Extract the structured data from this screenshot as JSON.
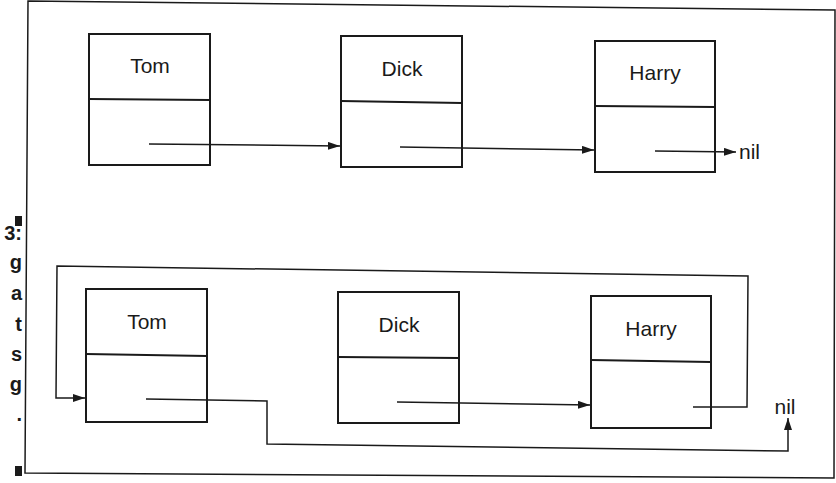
{
  "caption_fragments": {
    "top_marker": "■",
    "lines": [
      "3:",
      "g",
      "a",
      "t",
      "s",
      "g",
      "."
    ],
    "bottom_marker": "■"
  },
  "diagrams": [
    {
      "type": "linked-list",
      "nodes": [
        {
          "label": "Tom"
        },
        {
          "label": "Dick"
        },
        {
          "label": "Harry"
        }
      ],
      "terminator": "nil"
    },
    {
      "type": "circular-linked-list",
      "nodes": [
        {
          "label": "Tom"
        },
        {
          "label": "Dick"
        },
        {
          "label": "Harry"
        }
      ],
      "terminator": "nil"
    }
  ],
  "colors": {
    "stroke": "#1a1a1a",
    "background": "#ffffff"
  }
}
